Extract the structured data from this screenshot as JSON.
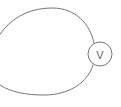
{
  "diagram": {
    "type": "circuit-schematic",
    "background_color": "#ffffff",
    "stroke_color": "#767676",
    "stroke_width": 1,
    "canvas": {
      "width": 121,
      "height": 107
    },
    "components": [
      {
        "id": "voltmeter",
        "kind": "meter",
        "symbol": "circle",
        "label": "V",
        "label_meaning": "voltmeter",
        "center_x": 100,
        "center_y": 54,
        "radius": 12,
        "fill": "#ffffff",
        "stroke_color": "#767676"
      },
      {
        "id": "wire-loop",
        "kind": "conductor",
        "shape": "closed-loop",
        "note": "large oval loop, left side cropped by image edge",
        "top_lead_end": {
          "x": 93,
          "y": 44
        },
        "bottom_lead_end": {
          "x": 93,
          "y": 64
        }
      }
    ],
    "paths": {
      "upper_wire": "M -14 92 C -16 36, 14 8, 52 8 C 76 8, 90 24, 94 43",
      "lower_wire": "M 93 65 C 88 82, 70 95, 44 95 C 6 95, -14 82, -18 56"
    }
  }
}
